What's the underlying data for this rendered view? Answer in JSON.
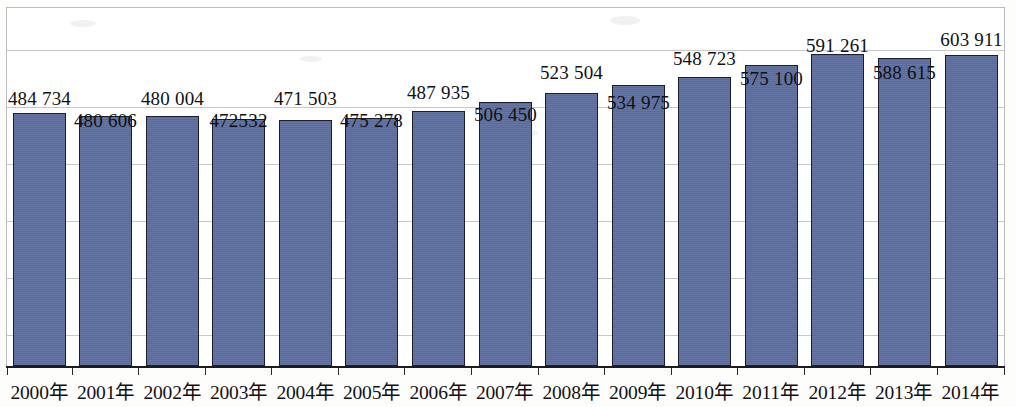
{
  "chart_data": {
    "type": "bar",
    "title": "",
    "xlabel": "",
    "ylabel": "",
    "grid": true,
    "legend": "none",
    "ylim": [
      0,
      700000
    ],
    "categories": [
      "2000年",
      "2001年",
      "2002年",
      "2003年",
      "2004年",
      "2005年",
      "2006年",
      "2007年",
      "2008年",
      "2009年",
      "2010年",
      "2011年",
      "2012年",
      "2013年",
      "2014年"
    ],
    "values": [
      484734,
      480606,
      480004,
      472532,
      471503,
      475278,
      487935,
      506450,
      523504,
      534975,
      548723,
      575100,
      591261,
      588615,
      603911
    ],
    "value_labels": [
      "484 734",
      "480 606",
      "480 004",
      "472532",
      "471 503",
      "475 278",
      "487 935",
      "506 450",
      "523 504",
      "534 975",
      "548 723",
      "575 100",
      "591 261",
      "588 615",
      "603 911"
    ],
    "series": [
      {
        "name": "",
        "values": [
          484734,
          480606,
          480004,
          472532,
          471503,
          475278,
          487935,
          506450,
          523504,
          534975,
          548723,
          575100,
          591261,
          588615,
          603911
        ]
      }
    ],
    "colors": {
      "bar_fill": "#5d6fa0",
      "bar_border": "#1b1f2c",
      "gridline": "#c6c9cb",
      "frame": "#b9bcbe",
      "axis": "#1c1c22",
      "text": "#101014",
      "background": "#fdfdfc"
    }
  },
  "layout": {
    "bar_tops": [
      113,
      116,
      116,
      119,
      120,
      118,
      111,
      102,
      93,
      85,
      77,
      65,
      54,
      58,
      55
    ],
    "bar_lefts": [
      13,
      79,
      146,
      212,
      279,
      345,
      412,
      479,
      545,
      612,
      678,
      745,
      811,
      878,
      945
    ],
    "bar_width": 53,
    "baseline_y": 366,
    "label_rows": [
      88,
      110,
      88,
      110,
      88,
      110,
      82,
      104,
      62,
      92,
      48,
      68,
      35,
      62,
      29
    ],
    "gridlines_y": [
      50,
      107,
      164,
      221,
      278,
      335
    ],
    "cat_centers": [
      39.5,
      106,
      172.5,
      239,
      305.5,
      372,
      438.5,
      505,
      571.5,
      638,
      704.5,
      771,
      837.5,
      904,
      970.5
    ]
  }
}
